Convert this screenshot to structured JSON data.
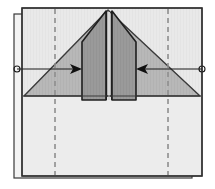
{
  "diagram": {
    "canvas": {
      "width": 215,
      "height": 189
    },
    "colors": {
      "background": "#ffffff",
      "paper_front": "#e9e9e9",
      "paper_shadow_sheet": "#f2f2f2",
      "triangle_fill": "#b8b8b8",
      "flap_fill": "#9a9a9a",
      "outline": "#2b2b2b",
      "outline_soft": "#555555",
      "crease_dashed": "#8e8e8e",
      "arrow": "#1a1a1a"
    },
    "layers": {
      "back_sheet": {
        "label": "offset-background-sheet",
        "x": 14,
        "y": 14,
        "width": 178,
        "height": 164
      },
      "main_sheet": {
        "label": "main-square-sheet",
        "x": 22,
        "y": 8,
        "width": 180,
        "height": 168
      },
      "lower_panel": {
        "label": "lower-flat-panel",
        "x": 24,
        "y": 96,
        "width": 176,
        "height": 79
      }
    },
    "triangle": {
      "label": "folded-triangle-flap",
      "apex": {
        "x": 108,
        "y": 10
      },
      "left_base": {
        "x": 24,
        "y": 96
      },
      "right_base": {
        "x": 200,
        "y": 96
      }
    },
    "flaps": [
      {
        "name": "left-center-flap",
        "top": {
          "x": 106,
          "y": 11
        },
        "outer_top": {
          "x": 82,
          "y": 42
        },
        "outer_bottom": {
          "x": 82,
          "y": 100
        },
        "inner_bottom": {
          "x": 106,
          "y": 100
        }
      },
      {
        "name": "right-center-flap",
        "top": {
          "x": 112,
          "y": 11
        },
        "outer_top": {
          "x": 136,
          "y": 42
        },
        "outer_bottom": {
          "x": 136,
          "y": 100
        },
        "inner_bottom": {
          "x": 112,
          "y": 100
        }
      }
    ],
    "crease_lines": [
      {
        "name": "left-crease-dashed",
        "x": 55,
        "y1": 10,
        "y2": 174
      },
      {
        "name": "right-crease-dashed",
        "x": 168,
        "y1": 10,
        "y2": 174
      },
      {
        "name": "center-gap-line",
        "x": 109,
        "y1": 11,
        "y2": 100
      },
      {
        "name": "horizontal-base-line",
        "y": 96,
        "x1": 24,
        "x2": 200
      }
    ],
    "arrows": [
      {
        "name": "left-fold-arrow",
        "direction": "right",
        "tail": {
          "x": 17,
          "y": 69
        },
        "head": {
          "x": 82,
          "y": 69
        },
        "marker": "loop-tail"
      },
      {
        "name": "right-fold-arrow",
        "direction": "left",
        "tail": {
          "x": 202,
          "y": 69
        },
        "head": {
          "x": 136,
          "y": 69
        },
        "marker": "loop-tail"
      }
    ],
    "labels": {
      "alt_text": "Paper folding diagram: fold both center flaps inward",
      "step_note": ""
    }
  }
}
